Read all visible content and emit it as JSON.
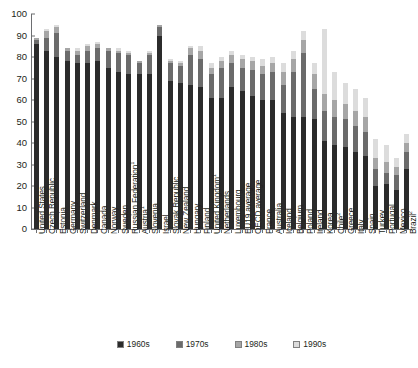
{
  "chart_data": {
    "type": "bar",
    "stacked": true,
    "title": "",
    "xlabel": "",
    "ylabel": "",
    "ylim": [
      0,
      100
    ],
    "yticks": [
      0,
      10,
      20,
      30,
      40,
      50,
      60,
      70,
      80,
      90,
      100
    ],
    "grid": false,
    "legend_position": "bottom",
    "legend": [
      "1960s",
      "1970s",
      "1980s",
      "1990s"
    ],
    "series_colors": [
      "#2b2b2b",
      "#6b6b6b",
      "#a6a6a6",
      "#dcdcdc"
    ],
    "categories": [
      "United States",
      "Czech Republic",
      "Estonia",
      "Germany",
      "Switzerland",
      "Denmark",
      "Canada",
      "Norway",
      "Sweden",
      "Russian Federation",
      "Austria",
      "Slovenia",
      "Israel",
      "Slovak Republic",
      "New Zealand",
      "Hungary",
      "Finland",
      "United Kingdom",
      "Netherlands",
      "Luxembourg",
      "EU19 average",
      "OECD average",
      "France",
      "Australia",
      "Iceland",
      "Belgium",
      "Poland",
      "Ireland",
      "Korea",
      "Chile",
      "Greece",
      "Italy",
      "Spain",
      "Turkey",
      "Portugal",
      "Mexico",
      "Brazil"
    ],
    "category_footnotes": {
      "Russian Federation": "1",
      "Austria": "1",
      "United Kingdom": "1",
      "Chile": "2",
      "Brazil": "2"
    },
    "series": [
      {
        "name": "1960s",
        "values": [
          86,
          83,
          80,
          78,
          77,
          77,
          78,
          75,
          73,
          72,
          72,
          72,
          90,
          69,
          68,
          67,
          66,
          61,
          61,
          66,
          64,
          62,
          60,
          60,
          54,
          52,
          52,
          51,
          41,
          39,
          38,
          36,
          34,
          20,
          21,
          18,
          28
        ]
      },
      {
        "name": "1970s",
        "values": [
          2,
          6,
          11,
          5,
          4,
          6,
          6,
          8,
          9,
          9,
          5,
          9,
          4,
          8,
          8,
          14,
          13,
          11,
          14,
          11,
          11,
          12,
          12,
          13,
          13,
          21,
          30,
          14,
          14,
          13,
          13,
          12,
          11,
          8,
          5,
          7,
          8
        ]
      },
      {
        "name": "1980s",
        "values": [
          1,
          3,
          3,
          1,
          2,
          2,
          2,
          1,
          1,
          1,
          1,
          1,
          1,
          1,
          1,
          3,
          4,
          3,
          3,
          4,
          4,
          4,
          4,
          4,
          6,
          6,
          6,
          7,
          8,
          8,
          7,
          7,
          7,
          5,
          5,
          4,
          4
        ]
      },
      {
        "name": "1990s",
        "values": [
          0,
          1,
          1,
          0,
          1,
          1,
          1,
          0,
          1,
          1,
          0,
          1,
          0,
          1,
          1,
          1,
          2,
          2,
          2,
          2,
          2,
          2,
          3,
          3,
          4,
          4,
          4,
          5,
          30,
          13,
          10,
          10,
          9,
          9,
          8,
          4,
          4
        ]
      }
    ]
  }
}
